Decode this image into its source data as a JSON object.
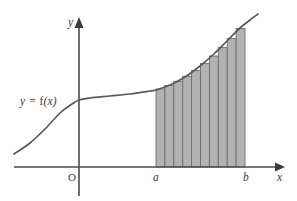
{
  "figure": {
    "background_color": "#ffffff"
  },
  "labels": {
    "curve_label": "y = f(x)",
    "y_axis": "y",
    "x_axis": "x",
    "origin": "O",
    "lower_limit": "a",
    "upper_limit": "b"
  },
  "colors": {
    "axis": "#4a4a52",
    "curve": "#585860",
    "rect_fill": "#b2b2b2",
    "rect_stroke": "#6e6e74",
    "text": "#3a3a42"
  },
  "chart_data": {
    "type": "area",
    "title": "",
    "xlabel": "x",
    "ylabel": "y",
    "curve_label": "y = f(x)",
    "grid": false,
    "legend_position": "none",
    "axes": {
      "origin_px": [
        79,
        167
      ],
      "x_axis_y_px": 167,
      "y_axis_x_px": 79,
      "x_axis_extent_px": [
        14,
        283
      ],
      "y_axis_extent_px": [
        18,
        196
      ]
    },
    "interval": {
      "a_px": 156,
      "b_px": 245,
      "a_label": "a",
      "b_label": "b"
    },
    "curve_points_px": [
      [
        14,
        154
      ],
      [
        30,
        143
      ],
      [
        46,
        128
      ],
      [
        60,
        113
      ],
      [
        72,
        104
      ],
      [
        79,
        100
      ],
      [
        90,
        98
      ],
      [
        110,
        96
      ],
      [
        130,
        94
      ],
      [
        150,
        91
      ],
      [
        156,
        90
      ],
      [
        170,
        85
      ],
      [
        185,
        77
      ],
      [
        200,
        66
      ],
      [
        215,
        53
      ],
      [
        228,
        40
      ],
      [
        240,
        28
      ],
      [
        250,
        20
      ],
      [
        258,
        14
      ]
    ],
    "rectangles": {
      "count": 10,
      "rule": "right-endpoint",
      "width_px": 8.9,
      "tops_px": [
        89.0,
        85.5,
        81.3,
        76.3,
        70.4,
        63.6,
        56.0,
        47.6,
        38.4,
        28.5
      ],
      "baseline_px": 167
    }
  }
}
